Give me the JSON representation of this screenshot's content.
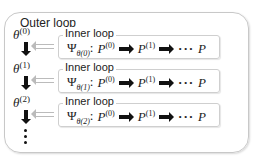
{
  "outer": {
    "label": "Outer loop"
  },
  "thetas": [
    {
      "base": "θ",
      "sup": "(0)"
    },
    {
      "base": "θ",
      "sup": "(1)"
    },
    {
      "base": "θ",
      "sup": "(2)"
    }
  ],
  "inner_loops": [
    {
      "label": "Inner loop",
      "psi": "Ψ",
      "sub": "θ(0)",
      "colon": ":",
      "p0": "P",
      "p0sup": "(0)",
      "p1": "P",
      "p1sup": "(1)",
      "dots": "···",
      "pend": "P"
    },
    {
      "label": "Inner loop",
      "psi": "Ψ",
      "sub": "θ(1)",
      "colon": ":",
      "p0": "P",
      "p0sup": "(0)",
      "p1": "P",
      "p1sup": "(1)",
      "dots": "···",
      "pend": "P"
    },
    {
      "label": "Inner loop",
      "psi": "Ψ",
      "sub": "θ(2)",
      "colon": ":",
      "p0": "P",
      "p0sup": "(0)",
      "p1": "P",
      "p1sup": "(1)",
      "dots": "···",
      "pend": "P"
    }
  ]
}
